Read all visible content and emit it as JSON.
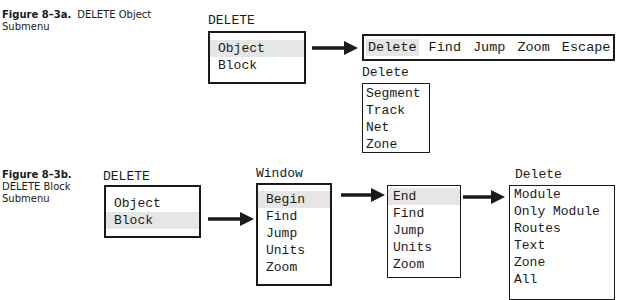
{
  "figure_a": {
    "caption_number": "Figure 8–3a.",
    "caption_title_line1": "DELETE Object",
    "caption_title_line2": "Submenu",
    "menu_title": "DELETE",
    "menu_items": [
      {
        "label": "Object",
        "highlighted": true
      },
      {
        "label": "Block",
        "highlighted": false
      }
    ],
    "horizontal_menu": [
      {
        "label": "Delete",
        "highlighted": true
      },
      {
        "label": "Find",
        "highlighted": false
      },
      {
        "label": "Jump",
        "highlighted": false
      },
      {
        "label": "Zoom",
        "highlighted": false
      },
      {
        "label": "Escape",
        "highlighted": false
      }
    ],
    "submenu_title": "Delete",
    "submenu_items": [
      "Segment",
      "Track",
      "Net",
      "Zone"
    ]
  },
  "figure_b": {
    "caption_number": "Figure 8–3b.",
    "caption_title_line1": "DELETE Block",
    "caption_title_line2": "Submenu",
    "menu_title": "DELETE",
    "menu_items": [
      {
        "label": "Object",
        "highlighted": false
      },
      {
        "label": "Block",
        "highlighted": true
      }
    ],
    "window_title": "Window",
    "window_items": [
      {
        "label": "Begin",
        "highlighted": true
      },
      {
        "label": "Find",
        "highlighted": false
      },
      {
        "label": "Jump",
        "highlighted": false
      },
      {
        "label": "Units",
        "highlighted": false
      },
      {
        "label": "Zoom",
        "highlighted": false
      }
    ],
    "end_items": [
      {
        "label": "End",
        "highlighted": true
      },
      {
        "label": "Find",
        "highlighted": false
      },
      {
        "label": "Jump",
        "highlighted": false
      },
      {
        "label": "Units",
        "highlighted": false
      },
      {
        "label": "Zoom",
        "highlighted": false
      }
    ],
    "delete_title": "Delete",
    "delete_items": [
      "Module",
      "Only Module",
      "Routes",
      "Text",
      "Zone",
      "All"
    ]
  }
}
